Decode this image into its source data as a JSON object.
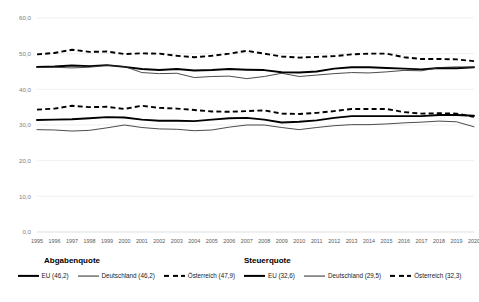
{
  "chart_data": {
    "type": "line",
    "title": "",
    "xlabel": "",
    "ylabel": "",
    "ylim": [
      0,
      60
    ],
    "yticks": [
      0,
      10,
      20,
      30,
      40,
      50,
      60
    ],
    "ytick_labels": [
      "0,0",
      "10,0",
      "20,0",
      "30,0",
      "40,0",
      "50,0",
      "60,0"
    ],
    "grid": true,
    "legend_position": "bottom",
    "x": [
      1995,
      1996,
      1997,
      1998,
      1999,
      2000,
      2001,
      2002,
      2003,
      2004,
      2005,
      2006,
      2007,
      2008,
      2009,
      2010,
      2011,
      2012,
      2013,
      2014,
      2015,
      2016,
      2017,
      2018,
      2019,
      2020
    ],
    "xtick_labels": [
      "1995",
      "1996",
      "1997",
      "1998",
      "1999",
      "2000",
      "2001",
      "2002",
      "2003",
      "2004",
      "2005",
      "2006",
      "2007",
      "2008",
      "2009",
      "2010",
      "2011",
      "2012",
      "2013",
      "2014",
      "2015",
      "2016",
      "2017",
      "2018",
      "2019",
      "2020"
    ],
    "groups": [
      {
        "name": "Abgabenquote",
        "series": [
          {
            "name": "EU (46,2)",
            "style": "thick",
            "values": [
              46.3,
              46.4,
              46.7,
              46.5,
              46.8,
              46.3,
              45.7,
              45.4,
              45.7,
              45.3,
              45.4,
              45.7,
              45.5,
              45.4,
              44.8,
              44.7,
              45.0,
              45.8,
              46.2,
              46.2,
              46.0,
              45.8,
              45.6,
              46.0,
              45.9,
              46.2
            ]
          },
          {
            "name": "Deutschland (46,2)",
            "style": "thin",
            "values": [
              46.1,
              46.2,
              46.0,
              46.2,
              46.7,
              46.4,
              44.7,
              44.4,
              44.5,
              43.3,
              43.6,
              43.7,
              43.0,
              43.6,
              44.5,
              43.6,
              44.0,
              44.4,
              44.7,
              44.6,
              44.9,
              45.3,
              45.2,
              46.1,
              46.3,
              46.2
            ]
          },
          {
            "name": "Österreich (47,9)",
            "style": "dashed",
            "values": [
              49.8,
              50.2,
              51.1,
              50.5,
              50.6,
              49.9,
              50.1,
              50.0,
              49.4,
              49.0,
              49.4,
              50.0,
              50.8,
              50.0,
              49.2,
              48.9,
              49.1,
              49.3,
              49.8,
              50.0,
              50.0,
              49.0,
              48.5,
              48.5,
              48.4,
              47.9
            ]
          }
        ]
      },
      {
        "name": "Steuerquote",
        "series": [
          {
            "name": "EU (32,6)",
            "style": "thick",
            "values": [
              31.4,
              31.5,
              31.6,
              31.9,
              32.2,
              32.1,
              31.5,
              31.2,
              31.2,
              31.1,
              31.5,
              31.9,
              32.0,
              31.5,
              30.7,
              30.9,
              31.3,
              32.0,
              32.5,
              32.5,
              32.5,
              32.5,
              32.5,
              32.8,
              32.8,
              32.6
            ]
          },
          {
            "name": "Deutschland (29,5)",
            "style": "thin",
            "values": [
              28.7,
              28.6,
              28.3,
              28.5,
              29.2,
              30.0,
              29.3,
              28.9,
              28.8,
              28.4,
              28.6,
              29.4,
              30.0,
              30.0,
              29.3,
              28.7,
              29.3,
              29.8,
              30.1,
              30.1,
              30.3,
              30.6,
              30.8,
              31.1,
              30.9,
              29.5
            ]
          },
          {
            "name": "Österreich (32,3)",
            "style": "dashed",
            "values": [
              34.3,
              34.6,
              35.4,
              35.0,
              35.1,
              34.5,
              35.4,
              34.8,
              34.6,
              34.2,
              33.8,
              33.7,
              33.9,
              34.1,
              33.2,
              33.1,
              33.4,
              33.9,
              34.5,
              34.5,
              34.5,
              33.6,
              33.2,
              33.3,
              33.2,
              32.3
            ]
          }
        ]
      }
    ]
  }
}
